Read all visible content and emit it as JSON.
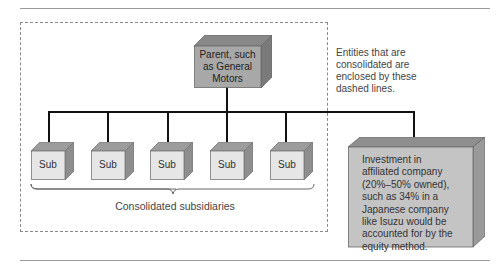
{
  "diagram": {
    "parent": {
      "label": "Parent, such as General Motors",
      "lines": [
        "Parent, such",
        "as General",
        "Motors"
      ]
    },
    "subsidiaries": [
      {
        "label": "Sub"
      },
      {
        "label": "Sub"
      },
      {
        "label": "Sub"
      },
      {
        "label": "Sub"
      },
      {
        "label": "Sub"
      }
    ],
    "subsidiaries_caption": "Consolidated subsidiaries",
    "dashed_note": {
      "lines": [
        "Entities that are",
        "consolidated are",
        "enclosed by these",
        "dashed lines."
      ]
    },
    "investment": {
      "lines": [
        "Investment in",
        "affiliated company",
        "(20%–50% owned),",
        "such as 34% in a",
        "Japanese company",
        "like Isuzu would be",
        "accounted for by the",
        "equity method."
      ]
    },
    "colors": {
      "parent_front": "#a8a8a8",
      "parent_top": "#888888",
      "parent_side": "#7a7a7a",
      "sub_front": "#e6e6e6",
      "sub_top": "#9c9c9c",
      "sub_side": "#8e8e8e",
      "investment_front": "#c4c4c4",
      "investment_top": "#8f8f8f",
      "investment_side": "#9a9a9a"
    }
  }
}
